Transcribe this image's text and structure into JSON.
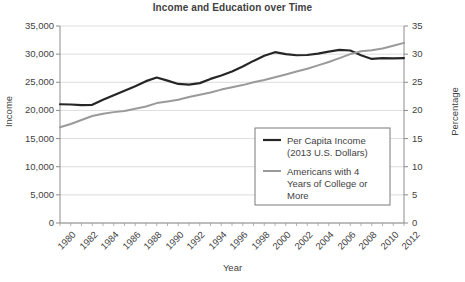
{
  "chart_data": {
    "type": "line",
    "title": "Income and Education over Time",
    "xlabel": "Year",
    "ylabel": "Income",
    "y2label": "Percentage",
    "grid": true,
    "legend_position": "center-right-inside",
    "xlim": [
      1980,
      2012
    ],
    "ylim": [
      0,
      35000
    ],
    "y2lim": [
      0,
      35
    ],
    "x": [
      1980,
      1981,
      1982,
      1983,
      1984,
      1985,
      1986,
      1987,
      1988,
      1989,
      1990,
      1991,
      1992,
      1993,
      1994,
      1995,
      1996,
      1997,
      1998,
      1999,
      2000,
      2001,
      2002,
      2003,
      2004,
      2005,
      2006,
      2007,
      2008,
      2009,
      2010,
      2011,
      2012
    ],
    "xtick_labels": [
      "1980",
      "1982",
      "1984",
      "1986",
      "1988",
      "1990",
      "1992",
      "1994",
      "1996",
      "1998",
      "2000",
      "2002",
      "2004",
      "2006",
      "2008",
      "2010",
      "2012"
    ],
    "ytick_labels": [
      "0",
      "5,000",
      "10,000",
      "15,000",
      "20,000",
      "25,000",
      "30,000",
      "35,000"
    ],
    "ytick_values": [
      0,
      5000,
      10000,
      15000,
      20000,
      25000,
      30000,
      35000
    ],
    "y2tick_labels": [
      "0",
      "5",
      "10",
      "15",
      "20",
      "25",
      "30",
      "35"
    ],
    "y2tick_values": [
      0,
      5,
      10,
      15,
      20,
      25,
      30,
      35
    ],
    "series": [
      {
        "name": "Per Capita Income (2013 U.S. Dollars)",
        "legend_label_line1": "Per Capita Income",
        "legend_label_line2": "(2013 U.S. Dollars)",
        "axis": "left",
        "color": "#262626",
        "width": 2.2,
        "values": [
          21100,
          21050,
          20950,
          21000,
          21900,
          22700,
          23500,
          24300,
          25200,
          25850,
          25300,
          24700,
          24600,
          24850,
          25600,
          26200,
          26900,
          27800,
          28800,
          29700,
          30350,
          30000,
          29800,
          29850,
          30100,
          30450,
          30750,
          30650,
          29800,
          29150,
          29300,
          29250,
          29300
        ]
      },
      {
        "name": "Americans with 4 Years of College or More",
        "legend_label_line1": "Americans with 4",
        "legend_label_line2": "Years of College or",
        "legend_label_line3": "More",
        "axis": "right",
        "color": "#9a9a9a",
        "width": 2.0,
        "values": [
          17.0,
          17.6,
          18.3,
          19.0,
          19.4,
          19.7,
          19.9,
          20.3,
          20.7,
          21.3,
          21.6,
          21.9,
          22.4,
          22.8,
          23.2,
          23.7,
          24.1,
          24.5,
          25.0,
          25.4,
          25.9,
          26.4,
          26.9,
          27.4,
          28.0,
          28.6,
          29.3,
          30.0,
          30.5,
          30.7,
          31.0,
          31.5,
          32.0
        ]
      }
    ]
  }
}
